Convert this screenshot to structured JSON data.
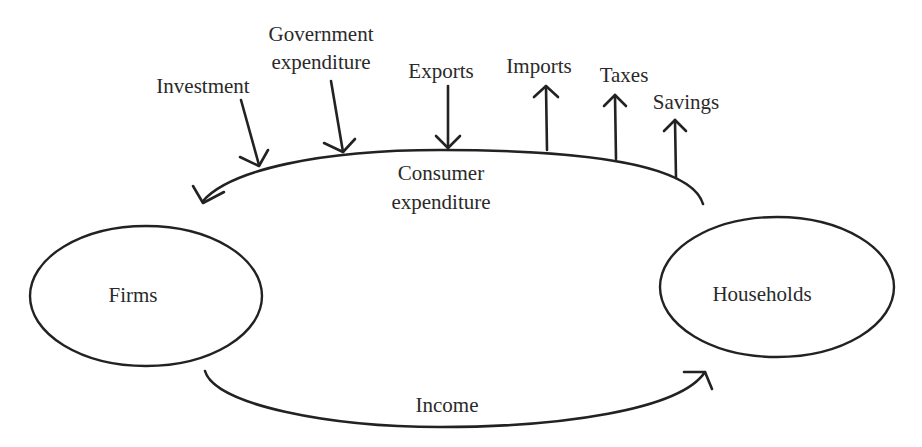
{
  "diagram": {
    "nodes": {
      "firms": {
        "label": "Firms"
      },
      "households": {
        "label": "Households"
      }
    },
    "flows": {
      "consumer_expenditure": {
        "line1": "Consumer",
        "line2": "expenditure"
      },
      "income": {
        "label": "Income"
      }
    },
    "injections": {
      "investment": {
        "label": "Investment"
      },
      "government": {
        "line1": "Government",
        "line2": "expenditure"
      },
      "exports": {
        "label": "Exports"
      }
    },
    "leakages": {
      "imports": {
        "label": "Imports"
      },
      "taxes": {
        "label": "Taxes"
      },
      "savings": {
        "label": "Savings"
      }
    }
  }
}
